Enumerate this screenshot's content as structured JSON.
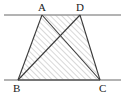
{
  "figure": {
    "type": "geometry-diagram",
    "colors": {
      "stroke": "#3a3a3a",
      "guide_line": "#9a9a9a",
      "hatch": "#8e8e8e",
      "label": "#1a1a1a",
      "background": "#ffffff"
    },
    "labels": [
      {
        "id": "A",
        "text": "A",
        "x": 38,
        "y": 2
      },
      {
        "id": "D",
        "text": "D",
        "x": 76,
        "y": 2
      },
      {
        "id": "B",
        "text": "B",
        "x": 13,
        "y": 83
      },
      {
        "id": "C",
        "text": "C",
        "x": 99,
        "y": 83
      }
    ],
    "points": {
      "A": {
        "x": 42,
        "y": 15
      },
      "D": {
        "x": 80,
        "y": 15
      },
      "B": {
        "x": 18,
        "y": 80
      },
      "C": {
        "x": 100,
        "y": 80
      },
      "intersection": {
        "x": 63,
        "y": 42
      }
    },
    "guide_lines": [
      {
        "name": "top-parallel-line",
        "x1": 4,
        "y1": 15,
        "x2": 121,
        "y2": 15
      },
      {
        "name": "bottom-parallel-line",
        "x1": 4,
        "y1": 80,
        "x2": 121,
        "y2": 80
      }
    ],
    "segments": [
      {
        "name": "segment-AB",
        "from": "A",
        "to": "B"
      },
      {
        "name": "segment-AC",
        "from": "A",
        "to": "C"
      },
      {
        "name": "segment-DB",
        "from": "D",
        "to": "B"
      },
      {
        "name": "segment-DC",
        "from": "D",
        "to": "C"
      },
      {
        "name": "segment-BC",
        "from": "B",
        "to": "C"
      }
    ],
    "shaded_region": {
      "name": "hatched-quadrilateral-ABCD",
      "vertices": [
        "A",
        "D",
        "C",
        "B"
      ],
      "fill_pattern": "diagonal-hatch-45deg"
    }
  }
}
